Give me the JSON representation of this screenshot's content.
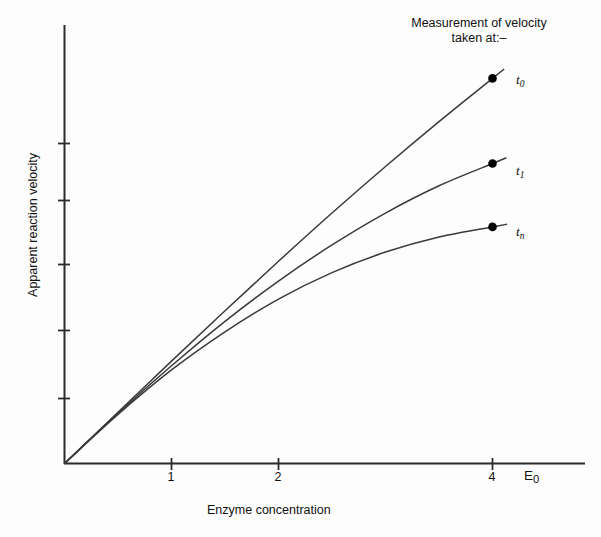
{
  "chart_data": {
    "type": "line",
    "title": "",
    "xlabel": "Enzyme concentration",
    "ylabel": "Apparent reaction velocity",
    "annotation": {
      "line1": "Measurement of velocity",
      "line2": "taken at:–"
    },
    "axis_variable": "E",
    "axis_variable_sub": "0",
    "xticks": [
      "1",
      "2",
      "4"
    ],
    "xtick_values": [
      1,
      2,
      4
    ],
    "xlim": [
      0,
      4.9
    ],
    "ylim": [
      0,
      1.0
    ],
    "yticks_labeled": false,
    "ytick_count": 5,
    "grid": false,
    "legend": "inline-endpoint-labels",
    "line_color": "#333333",
    "marker_color": "#000000",
    "background": "#fdfdfd",
    "series": [
      {
        "name": "t0",
        "label_base": "t",
        "label_sub": "0",
        "description": "Near-linear response; velocity measured at time zero",
        "x": [
          0,
          0.5,
          1.0,
          1.5,
          2.0,
          2.5,
          3.0,
          3.5,
          4.0
        ],
        "values": [
          0.0,
          0.122,
          0.244,
          0.364,
          0.482,
          0.597,
          0.708,
          0.815,
          0.918
        ],
        "endpoint": {
          "x": 4,
          "y": 0.918
        }
      },
      {
        "name": "t1",
        "label_base": "t",
        "label_sub": "1",
        "description": "Moderately curved; velocity measured at a later time",
        "x": [
          0,
          0.5,
          1.0,
          1.5,
          2.0,
          2.5,
          3.0,
          3.5,
          4.0
        ],
        "values": [
          0.0,
          0.12,
          0.233,
          0.339,
          0.435,
          0.521,
          0.597,
          0.662,
          0.715
        ],
        "endpoint": {
          "x": 4,
          "y": 0.715
        }
      },
      {
        "name": "tn",
        "label_base": "t",
        "label_sub": "n",
        "description": "Strongly saturating; velocity measured at the longest time",
        "x": [
          0,
          0.5,
          1.0,
          1.5,
          2.0,
          2.5,
          3.0,
          3.5,
          4.0
        ],
        "values": [
          0.0,
          0.117,
          0.223,
          0.314,
          0.392,
          0.455,
          0.504,
          0.54,
          0.564
        ],
        "endpoint": {
          "x": 4,
          "y": 0.564
        }
      }
    ]
  }
}
